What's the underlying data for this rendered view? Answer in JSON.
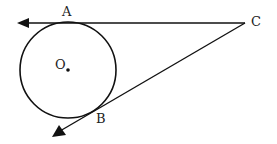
{
  "diagram": {
    "type": "geometry",
    "stroke_color": "#111111",
    "background": "#ffffff",
    "points": {
      "A": {
        "label": "A",
        "x": 68,
        "y": 23
      },
      "B": {
        "label": "B",
        "x": 100,
        "y": 110
      },
      "C": {
        "label": "C",
        "x": 245,
        "y": 23
      },
      "O": {
        "label": "O",
        "x": 68,
        "y": 70
      }
    },
    "circle": {
      "center": "O",
      "cx": 68,
      "cy": 70,
      "r": 48
    },
    "lines": [
      {
        "name": "tangent-CA",
        "from": "C",
        "to_arrow": [
          17,
          23
        ],
        "passes_through": "A"
      },
      {
        "name": "tangent-CB",
        "from": "C",
        "to_arrow": [
          52,
          137
        ],
        "passes_through": "B"
      }
    ]
  },
  "labels": {
    "A": "A",
    "B": "B",
    "C": "C",
    "O": "O"
  }
}
